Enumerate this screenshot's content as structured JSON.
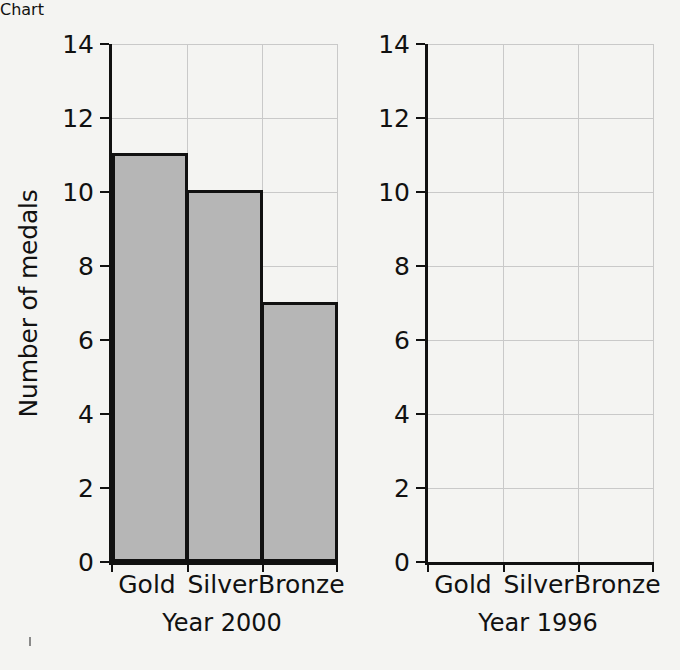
{
  "chart_data": {
    "type": "bar",
    "title": "",
    "xlabel": "",
    "ylabel": "Number of medals",
    "ylim": [
      0,
      14
    ],
    "ytick_labels": [
      "0",
      "2",
      "4",
      "6",
      "8",
      "10",
      "12",
      "14"
    ],
    "yticks": [
      0,
      2,
      4,
      6,
      8,
      10,
      12,
      14
    ],
    "grid": true,
    "legend": "none",
    "categories": [
      "Gold",
      "Silver",
      "Bronze"
    ],
    "panels": [
      {
        "name": "Year 2000",
        "caption": "Year 2000",
        "values": [
          11,
          10,
          7
        ],
        "has_bars": true
      },
      {
        "name": "Year 1996",
        "caption": "Year 1996",
        "values": [
          null,
          null,
          null
        ],
        "has_bars": false
      }
    ],
    "series": [
      {
        "name": "Year 2000",
        "values": [
          11,
          10,
          7
        ]
      },
      {
        "name": "Year 1996",
        "values": [
          null,
          null,
          null
        ]
      }
    ]
  },
  "style": {
    "bar_fill": "#b6b6b6",
    "bar_edge": "#111111",
    "axis_color": "#111111",
    "grid_color": "#c9c9c9",
    "background": "#f4f4f2"
  },
  "axis": {
    "y_title": "Number of medals",
    "y_ticks": [
      "14",
      "12",
      "10",
      "8",
      "6",
      "4",
      "2",
      "0"
    ]
  },
  "left_panel": {
    "caption": "Year 2000",
    "cat_gold": "Gold",
    "cat_silver": "Silver",
    "cat_bronze": "Bronze",
    "y_ticks": [
      "14",
      "12",
      "10",
      "8",
      "6",
      "4",
      "2",
      "0"
    ]
  },
  "right_panel": {
    "caption": "Year 1996",
    "cat_gold": "Gold",
    "cat_silver": "Silver",
    "cat_bronze": "Bronze",
    "y_ticks": [
      "14",
      "12",
      "10",
      "8",
      "6",
      "4",
      "2",
      "0"
    ]
  }
}
